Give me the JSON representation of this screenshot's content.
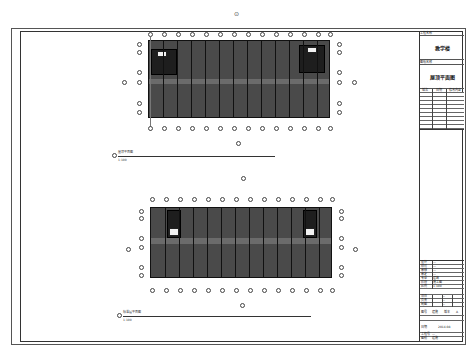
{
  "drawing": {
    "top_marker": "⊙",
    "title_block": {
      "project_label": "工程名称",
      "project_name": "教学楼",
      "drawing_label": "图纸名称",
      "drawing_name": "屋顶平面图",
      "revision_header": [
        "版次",
        "日期",
        "修改内容"
      ],
      "info_rows": [
        {
          "k": "设计",
          "v": "—"
        },
        {
          "k": "校对",
          "v": "—"
        },
        {
          "k": "审核",
          "v": "—"
        },
        {
          "k": "审定",
          "v": "—"
        },
        {
          "k": "专业",
          "v": "建筑"
        },
        {
          "k": "阶段",
          "v": "施工图"
        },
        {
          "k": "比例",
          "v": "1:100"
        }
      ],
      "sign_rows": [
        {
          "k": "项目",
          "v": "—"
        },
        {
          "k": "负责",
          "v": "—"
        },
        {
          "k": "制图",
          "v": "—"
        }
      ],
      "number_row": {
        "k1": "图号",
        "v1": "建施",
        "k2": "版本",
        "v2": "A"
      },
      "date_row": {
        "k": "日期",
        "v": "2014.08"
      },
      "footer_rows": [
        {
          "k": "工程号",
          "v": "—"
        },
        {
          "k": "图别",
          "v": "建施"
        }
      ]
    },
    "plans": [
      {
        "name": "upper-plan",
        "caption": "屋顶平面图",
        "scale": "1:100",
        "axis_count": 14
      },
      {
        "name": "lower-plan",
        "caption": "标准层平面图",
        "scale": "1:100",
        "axis_count": 14
      }
    ],
    "colors": {
      "fill": "#4a4a4a",
      "stair": "#1e1e1e",
      "line": "#333333",
      "paper": "#ffffff"
    }
  }
}
